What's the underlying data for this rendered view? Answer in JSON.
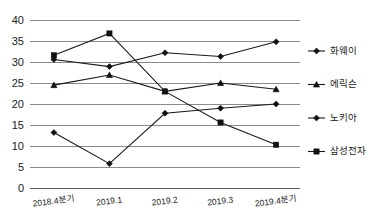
{
  "chart_data": {
    "type": "line",
    "title": "",
    "subtitle": "",
    "xlabel": "",
    "ylabel": "",
    "categories": [
      "2018.4분기",
      "2019.1",
      "2019.2",
      "2019.3",
      "2019.4분기"
    ],
    "ylim": [
      0,
      40
    ],
    "ytick_values": [
      0,
      5,
      10,
      15,
      20,
      25,
      30,
      35,
      40
    ],
    "ytick_labels": [
      "0",
      "5",
      "10",
      "15",
      "20",
      "25",
      "30",
      "35",
      "40"
    ],
    "grid": true,
    "legend_position": "right",
    "series": [
      {
        "name": "화웨이",
        "marker": "diamond",
        "color": "#111111",
        "values": [
          30.6,
          28.9,
          32.2,
          31.3,
          34.8
        ]
      },
      {
        "name": "에릭슨",
        "marker": "triangle",
        "color": "#111111",
        "values": [
          24.5,
          26.9,
          23.0,
          25.0,
          23.5
        ]
      },
      {
        "name": "노키아",
        "marker": "diamond",
        "color": "#111111",
        "values": [
          13.2,
          5.8,
          17.8,
          19.0,
          20.0
        ]
      },
      {
        "name": "삼성전자",
        "marker": "square",
        "color": "#111111",
        "values": [
          31.6,
          36.8,
          23.0,
          15.6,
          10.3
        ]
      }
    ]
  },
  "legend": {
    "items": [
      {
        "label": "화웨이"
      },
      {
        "label": "에릭슨"
      },
      {
        "label": "노키아"
      },
      {
        "label": "삼성전자"
      }
    ]
  },
  "colors": {
    "ink": "#111111",
    "grid": "#8a8a8a",
    "axis": "#5a5a5a",
    "background": "#ffffff"
  }
}
